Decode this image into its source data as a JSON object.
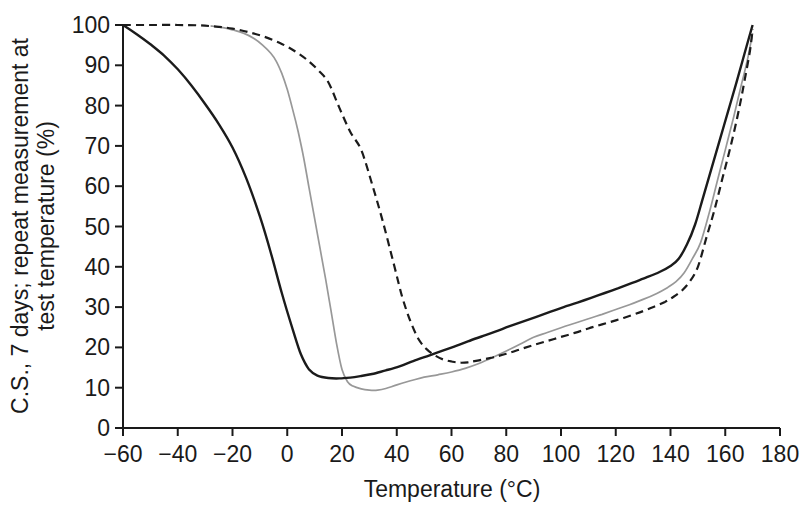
{
  "figure": {
    "background_color": "#ffffff",
    "axis_color": "#1a1a1a"
  },
  "chart_data": {
    "type": "line",
    "title": "",
    "xlabel": "Temperature (°C)",
    "ylabel_line1": "C.S., 7 days; repeat measurement at",
    "ylabel_line2": "test temperature (%)",
    "xlim": [
      -60,
      180
    ],
    "ylim": [
      0,
      100
    ],
    "x_ticks": [
      -60,
      -40,
      -20,
      0,
      20,
      40,
      60,
      80,
      100,
      120,
      140,
      160,
      180
    ],
    "y_ticks": [
      0,
      10,
      20,
      30,
      40,
      50,
      60,
      70,
      80,
      90,
      100
    ],
    "grid": false,
    "legend_position": "none",
    "series": [
      {
        "name": "solid-gray-curve",
        "line_style": "solid",
        "color": "#989898",
        "width": 1.7,
        "points": [
          [
            -28,
            99.8
          ],
          [
            -24,
            99.4
          ],
          [
            -20,
            98.8
          ],
          [
            -16,
            98
          ],
          [
            -12,
            96.6
          ],
          [
            -9,
            95
          ],
          [
            -6,
            93
          ],
          [
            -4,
            91
          ],
          [
            -2,
            88
          ],
          [
            0,
            84
          ],
          [
            2,
            79
          ],
          [
            4,
            73.5
          ],
          [
            6,
            67
          ],
          [
            8,
            59.5
          ],
          [
            10,
            52
          ],
          [
            12,
            44.5
          ],
          [
            14,
            37
          ],
          [
            16,
            29
          ],
          [
            18,
            21
          ],
          [
            20,
            14.5
          ],
          [
            22,
            11.5
          ],
          [
            24,
            10.4
          ],
          [
            27,
            9.7
          ],
          [
            30,
            9.4
          ],
          [
            33,
            9.4
          ],
          [
            36,
            9.8
          ],
          [
            40,
            10.7
          ],
          [
            45,
            11.7
          ],
          [
            50,
            12.6
          ],
          [
            55,
            13.2
          ],
          [
            60,
            13.9
          ],
          [
            65,
            14.8
          ],
          [
            70,
            16
          ],
          [
            75,
            17.5
          ],
          [
            80,
            19.1
          ],
          [
            85,
            20.8
          ],
          [
            90,
            22.5
          ],
          [
            95,
            23.7
          ],
          [
            100,
            24.9
          ],
          [
            105,
            26
          ],
          [
            110,
            27.1
          ],
          [
            115,
            28.2
          ],
          [
            120,
            29.4
          ],
          [
            125,
            30.6
          ],
          [
            130,
            31.9
          ],
          [
            135,
            33.4
          ],
          [
            139,
            34.9
          ],
          [
            142,
            36.3
          ],
          [
            145,
            38.5
          ],
          [
            148,
            42
          ],
          [
            151,
            46
          ],
          [
            154,
            53
          ],
          [
            157,
            61
          ],
          [
            160,
            69
          ],
          [
            163,
            77
          ],
          [
            166,
            85.5
          ],
          [
            168,
            91
          ],
          [
            170,
            98
          ]
        ]
      },
      {
        "name": "solid-dark-curve",
        "line_style": "solid",
        "color": "#1b1b1b",
        "width": 2.4,
        "points": [
          [
            -60,
            100
          ],
          [
            -55,
            97.7
          ],
          [
            -50,
            95.2
          ],
          [
            -45,
            92.4
          ],
          [
            -40,
            89
          ],
          [
            -35,
            85
          ],
          [
            -30,
            80.4
          ],
          [
            -25,
            75.4
          ],
          [
            -20,
            69.6
          ],
          [
            -15,
            62
          ],
          [
            -10,
            52.5
          ],
          [
            -6,
            43.5
          ],
          [
            -2,
            33.5
          ],
          [
            2,
            24.5
          ],
          [
            5,
            18.3
          ],
          [
            8,
            14.5
          ],
          [
            11,
            13
          ],
          [
            15,
            12.4
          ],
          [
            19,
            12.3
          ],
          [
            23,
            12.5
          ],
          [
            27,
            12.9
          ],
          [
            31,
            13.4
          ],
          [
            36,
            14.3
          ],
          [
            41,
            15.3
          ],
          [
            46,
            16.6
          ],
          [
            51,
            17.8
          ],
          [
            56,
            19
          ],
          [
            61,
            20.2
          ],
          [
            66,
            21.5
          ],
          [
            71,
            22.7
          ],
          [
            76,
            23.9
          ],
          [
            81,
            25.2
          ],
          [
            86,
            26.4
          ],
          [
            91,
            27.6
          ],
          [
            96,
            28.8
          ],
          [
            101,
            30
          ],
          [
            106,
            31.1
          ],
          [
            111,
            32.3
          ],
          [
            116,
            33.5
          ],
          [
            121,
            34.7
          ],
          [
            126,
            36
          ],
          [
            131,
            37.3
          ],
          [
            136,
            38.7
          ],
          [
            140,
            40.2
          ],
          [
            143,
            42
          ],
          [
            146,
            45.5
          ],
          [
            149,
            50.5
          ],
          [
            152,
            57.5
          ],
          [
            155,
            64.5
          ],
          [
            158,
            71.5
          ],
          [
            161,
            78.5
          ],
          [
            164,
            85.5
          ],
          [
            167,
            92.8
          ],
          [
            170,
            100
          ]
        ]
      },
      {
        "name": "dashed-dark-curve",
        "line_style": "dashed",
        "dash": [
          8,
          5
        ],
        "color": "#1b1b1b",
        "width": 2.2,
        "points": [
          [
            -60,
            100
          ],
          [
            -50,
            100
          ],
          [
            -40,
            100
          ],
          [
            -32,
            99.9
          ],
          [
            -26,
            99.6
          ],
          [
            -20,
            99.1
          ],
          [
            -14,
            98.2
          ],
          [
            -8,
            97
          ],
          [
            -2,
            95.3
          ],
          [
            3,
            93.4
          ],
          [
            7,
            91.5
          ],
          [
            11,
            89
          ],
          [
            15,
            85.8
          ],
          [
            19,
            79.5
          ],
          [
            23,
            73.5
          ],
          [
            27,
            69
          ],
          [
            31,
            60.5
          ],
          [
            35,
            51
          ],
          [
            39,
            40.5
          ],
          [
            42,
            32.5
          ],
          [
            45,
            26.5
          ],
          [
            48,
            22
          ],
          [
            51,
            19.5
          ],
          [
            54,
            18
          ],
          [
            57,
            17
          ],
          [
            60,
            16.5
          ],
          [
            63,
            16.2
          ],
          [
            66,
            16.3
          ],
          [
            70,
            16.8
          ],
          [
            75,
            17.5
          ],
          [
            80,
            18.4
          ],
          [
            85,
            19.5
          ],
          [
            90,
            20.6
          ],
          [
            95,
            21.6
          ],
          [
            100,
            22.6
          ],
          [
            105,
            23.6
          ],
          [
            110,
            24.7
          ],
          [
            115,
            25.7
          ],
          [
            120,
            26.7
          ],
          [
            125,
            27.8
          ],
          [
            130,
            29
          ],
          [
            134,
            30.1
          ],
          [
            138,
            31.3
          ],
          [
            141,
            32.5
          ],
          [
            144,
            34
          ],
          [
            147,
            36.3
          ],
          [
            150,
            40
          ],
          [
            153,
            47
          ],
          [
            156,
            54
          ],
          [
            159,
            62
          ],
          [
            162,
            70
          ],
          [
            165,
            79
          ],
          [
            167,
            86
          ],
          [
            169,
            93.5
          ],
          [
            170,
            99
          ]
        ]
      }
    ]
  }
}
